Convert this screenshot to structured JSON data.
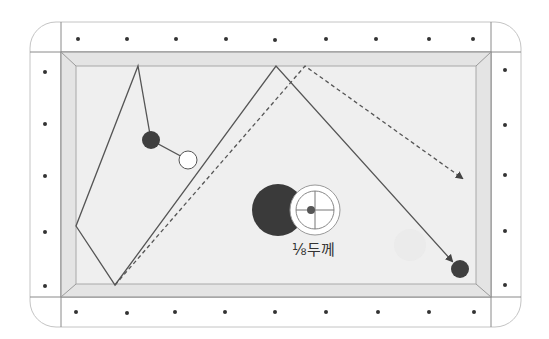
{
  "diagram": {
    "label": "⅛두께",
    "colors": {
      "rail": "#ffffff",
      "rail_line": "#9a9a9a",
      "cushion": "#e6e6e6",
      "cloth": "#efefef",
      "diamond": "#333333",
      "path": "#555555",
      "dark_ball": "#3f3f3f",
      "white_ball": "#ffffff"
    },
    "balls": [
      {
        "id": "object-ball-1",
        "color": "dark",
        "cx": 151,
        "cy": 140,
        "r": 9
      },
      {
        "id": "cue-ball",
        "color": "white",
        "cx": 188,
        "cy": 160,
        "r": 9
      },
      {
        "id": "target-ball",
        "color": "dark",
        "cx": 460,
        "cy": 269,
        "r": 9
      }
    ],
    "thickness_indicator": {
      "object_ball": {
        "cx": 278,
        "cy": 210,
        "r": 26
      },
      "cue_ball": {
        "cx": 315,
        "cy": 210,
        "r": 25
      },
      "contact_point": {
        "cx": 311,
        "cy": 210
      }
    }
  }
}
